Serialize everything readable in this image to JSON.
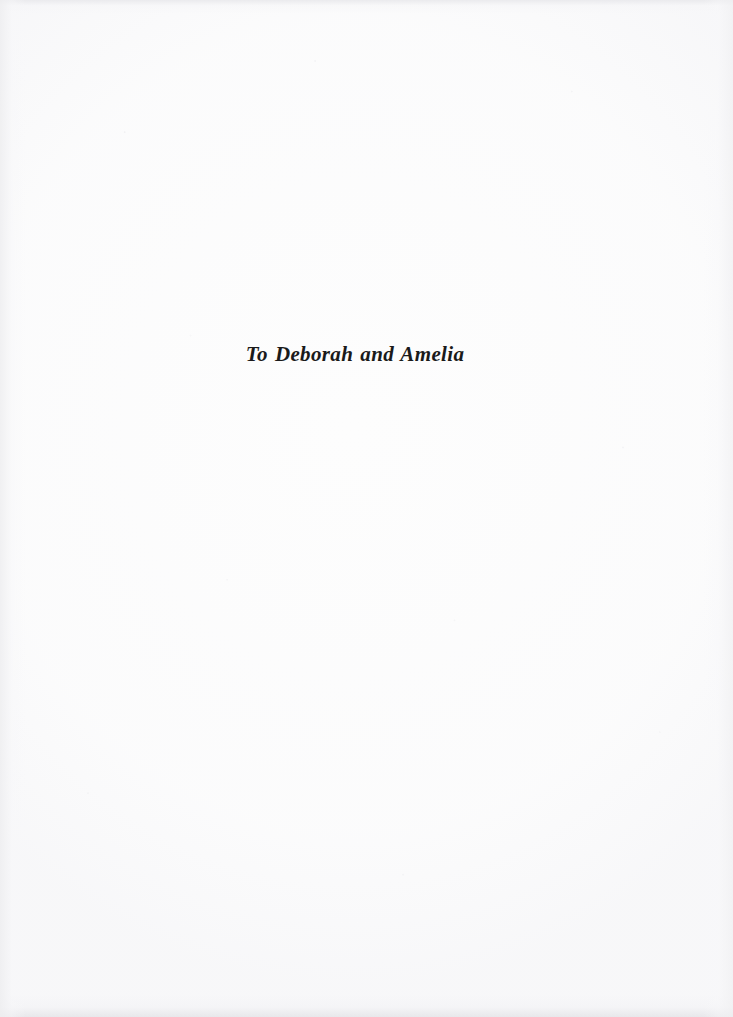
{
  "page": {
    "kind": "book-dedication-page",
    "background_color": "#fdfdfd",
    "ink_color": "#1a1a1a"
  },
  "dedication": {
    "text": "To Deborah and Amelia"
  }
}
